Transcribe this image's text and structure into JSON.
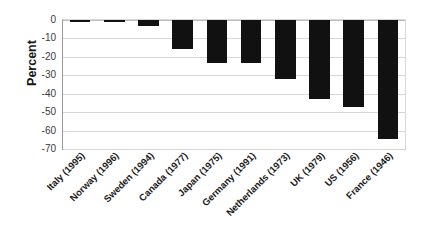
{
  "chart_data": {
    "type": "bar",
    "title": "",
    "xlabel": "",
    "ylabel": "Percent",
    "ylim": [
      -70,
      0
    ],
    "grid": true,
    "legend": "none",
    "orientation": "vertical",
    "bar_color": "#111111",
    "categories": [
      "Italy (1995)",
      "Norway (1996)",
      "Sweden (1994)",
      "Canada (1977)",
      "Japan (1975)",
      "Germany (1991)",
      "Netherlands (1973)",
      "UK (1979)",
      "US (1956)",
      "France (1946)"
    ],
    "values": [
      -0.3,
      -0.4,
      -3.5,
      -15.5,
      -23.5,
      -23.3,
      -31.8,
      -43.0,
      -47.3,
      -64.5
    ],
    "yticks": [
      0,
      -10,
      -20,
      -30,
      -40,
      -50,
      -60,
      -70
    ],
    "ytick_labels": [
      "0",
      "-10",
      "-20",
      "-30",
      "-40",
      "-50",
      "-60",
      "-70"
    ]
  }
}
